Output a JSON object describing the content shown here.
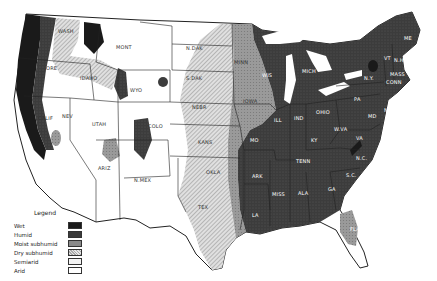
{
  "map": {
    "title": "Climatic moisture regions of the United States",
    "legend": {
      "title": "Legend",
      "items": [
        {
          "label": "Wet",
          "color": "#1a1a1a",
          "pattern": "solid"
        },
        {
          "label": "Humid",
          "color": "#3a3a3a",
          "pattern": "stipple-dark"
        },
        {
          "label": "Moist subhumid",
          "color": "#8a8a8a",
          "pattern": "stipple-medium"
        },
        {
          "label": "Dry subhumid",
          "color": "#c4c4c4",
          "pattern": "hatch"
        },
        {
          "label": "Semiarid",
          "color": "#f4f4f4",
          "pattern": "outlined"
        },
        {
          "label": "Arid",
          "color": "#ffffff",
          "pattern": "blank"
        }
      ]
    },
    "state_labels": [
      {
        "name": "WASH",
        "x": 58,
        "y": 33,
        "zone": "light"
      },
      {
        "name": "ORE",
        "x": 46,
        "y": 70,
        "zone": "light"
      },
      {
        "name": "CALIF",
        "x": 38,
        "y": 120,
        "zone": "light"
      },
      {
        "name": "NEV",
        "x": 66,
        "y": 118,
        "zone": "light"
      },
      {
        "name": "IDAHO",
        "x": 86,
        "y": 77,
        "zone": "light"
      },
      {
        "name": "MONT",
        "x": 120,
        "y": 49,
        "zone": "light"
      },
      {
        "name": "WYO",
        "x": 134,
        "y": 92,
        "zone": "light"
      },
      {
        "name": "UTAH",
        "x": 95,
        "y": 126,
        "zone": "light"
      },
      {
        "name": "COLO",
        "x": 150,
        "y": 128,
        "zone": "light"
      },
      {
        "name": "ARIZ",
        "x": 100,
        "y": 170,
        "zone": "light"
      },
      {
        "name": "N.MEX",
        "x": 136,
        "y": 182,
        "zone": "light"
      },
      {
        "name": "N.DAK",
        "x": 191,
        "y": 50,
        "zone": "light"
      },
      {
        "name": "S.DAK",
        "x": 191,
        "y": 80,
        "zone": "light"
      },
      {
        "name": "NEBR",
        "x": 197,
        "y": 109,
        "zone": "light"
      },
      {
        "name": "KANS",
        "x": 203,
        "y": 144,
        "zone": "light"
      },
      {
        "name": "OKLA",
        "x": 211,
        "y": 174,
        "zone": "light"
      },
      {
        "name": "TEX",
        "x": 202,
        "y": 209,
        "zone": "light"
      },
      {
        "name": "MINN",
        "x": 238,
        "y": 64,
        "zone": "light"
      },
      {
        "name": "IOWA",
        "x": 247,
        "y": 103,
        "zone": "light"
      },
      {
        "name": "MO",
        "x": 252,
        "y": 142,
        "zone": "dark"
      },
      {
        "name": "ARK",
        "x": 256,
        "y": 178,
        "zone": "dark"
      },
      {
        "name": "LA",
        "x": 254,
        "y": 217,
        "zone": "dark"
      },
      {
        "name": "WIS",
        "x": 265,
        "y": 77,
        "zone": "dark"
      },
      {
        "name": "ILL",
        "x": 277,
        "y": 122,
        "zone": "dark"
      },
      {
        "name": "MICH",
        "x": 308,
        "y": 73,
        "zone": "dark"
      },
      {
        "name": "IND",
        "x": 297,
        "y": 120,
        "zone": "dark"
      },
      {
        "name": "OHIO",
        "x": 320,
        "y": 114,
        "zone": "dark"
      },
      {
        "name": "KY",
        "x": 313,
        "y": 142,
        "zone": "dark"
      },
      {
        "name": "TENN",
        "x": 301,
        "y": 163,
        "zone": "dark"
      },
      {
        "name": "MISS",
        "x": 276,
        "y": 196,
        "zone": "dark"
      },
      {
        "name": "ALA",
        "x": 301,
        "y": 195,
        "zone": "dark"
      },
      {
        "name": "GA",
        "x": 330,
        "y": 191,
        "zone": "dark"
      },
      {
        "name": "FLA",
        "x": 352,
        "y": 231,
        "zone": "dark"
      },
      {
        "name": "S.C.",
        "x": 349,
        "y": 177,
        "zone": "dark"
      },
      {
        "name": "N.C.",
        "x": 357,
        "y": 155,
        "zone": "dark"
      },
      {
        "name": "VA",
        "x": 354,
        "y": 145,
        "zone": "dark"
      },
      {
        "name": "W.VA",
        "x": 338,
        "y": 131,
        "zone": "dark"
      },
      {
        "name": "PA",
        "x": 357,
        "y": 101,
        "zone": "dark"
      },
      {
        "name": "N.Y.",
        "x": 368,
        "y": 77,
        "zone": "dark"
      },
      {
        "name": "ME",
        "x": 408,
        "y": 40,
        "zone": "dark"
      },
      {
        "name": "VT",
        "x": 388,
        "y": 58,
        "zone": "dark"
      },
      {
        "name": "N.H.",
        "x": 396,
        "y": 60,
        "zone": "dark"
      },
      {
        "name": "MASS",
        "x": 393,
        "y": 76,
        "zone": "dark"
      },
      {
        "name": "CONN",
        "x": 390,
        "y": 84,
        "zone": "dark"
      },
      {
        "name": "N.J.",
        "x": 386,
        "y": 112,
        "zone": "dark"
      },
      {
        "name": "MD",
        "x": 372,
        "y": 117,
        "zone": "dark"
      }
    ]
  }
}
